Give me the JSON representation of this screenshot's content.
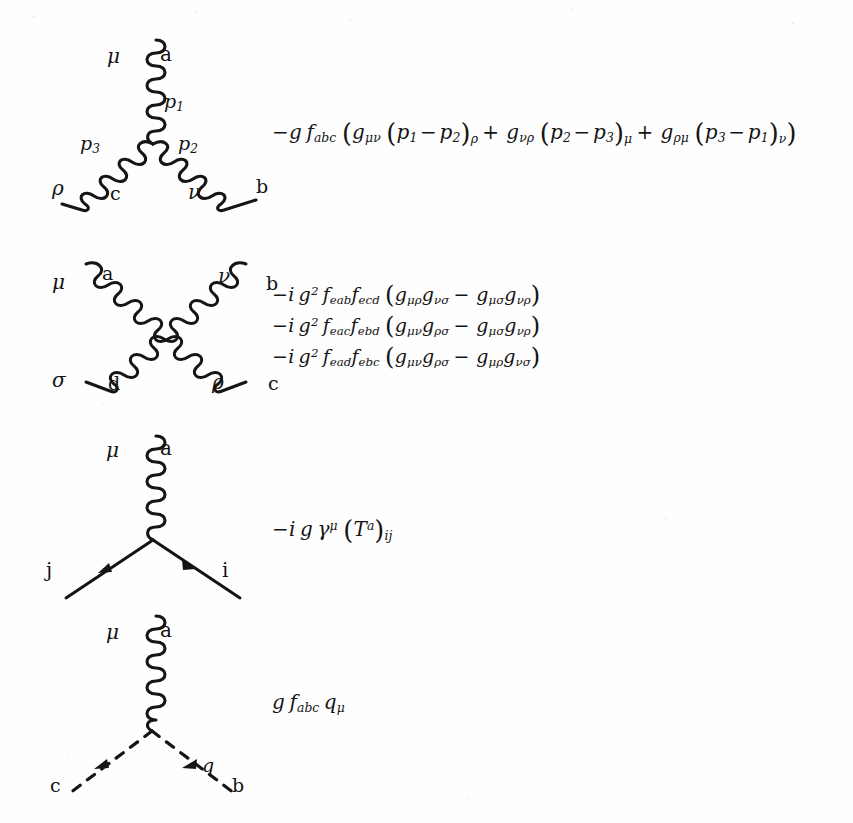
{
  "document": {
    "kind": "feynman-rules-figure",
    "ink_color": "#151515",
    "background_color": "#fefefe"
  },
  "rules": [
    {
      "id": "three-gluon-vertex",
      "diagram": {
        "type": "three-gluon-vertex",
        "legs": [
          {
            "id": "leg-top",
            "style": "gluon",
            "lorentz_index": "μ",
            "color_index": "a",
            "momentum": "p₁"
          },
          {
            "id": "leg-lower-right",
            "style": "gluon",
            "lorentz_index": "ν",
            "color_index": "b",
            "momentum": "p₂"
          },
          {
            "id": "leg-lower-left",
            "style": "gluon",
            "lorentz_index": "ρ",
            "color_index": "c",
            "momentum": "p₃"
          }
        ]
      },
      "formula_lines": [
        "−g f_abc ( g_μν (p₁ − p₂)_ρ + g_νρ (p₂ − p₃)_μ + g_ρμ (p₃ − p₁)_ν )"
      ]
    },
    {
      "id": "four-gluon-vertex",
      "diagram": {
        "type": "four-gluon-vertex",
        "legs": [
          {
            "id": "leg-upper-left",
            "style": "gluon",
            "lorentz_index": "μ",
            "color_index": "a"
          },
          {
            "id": "leg-upper-right",
            "style": "gluon",
            "lorentz_index": "ν",
            "color_index": "b"
          },
          {
            "id": "leg-lower-left",
            "style": "gluon",
            "lorentz_index": "σ",
            "color_index": "d"
          },
          {
            "id": "leg-lower-right",
            "style": "gluon",
            "lorentz_index": "ρ",
            "color_index": "c"
          }
        ]
      },
      "formula_lines": [
        "−i g² f_eab f_ecd ( g_μρ g_νσ − g_μσ g_νρ )",
        "−i g² f_eac f_ebd ( g_μν g_ρσ − g_μσ g_νρ )",
        "−i g² f_ead f_ebc ( g_μν g_ρσ − g_μρ g_νσ )"
      ]
    },
    {
      "id": "quark-gluon-vertex",
      "diagram": {
        "type": "quark-gluon-vertex",
        "legs": [
          {
            "id": "leg-gluon",
            "style": "gluon",
            "lorentz_index": "μ",
            "color_index": "a"
          },
          {
            "id": "leg-quark-left",
            "style": "fermion",
            "flavor_index": "j",
            "arrow": "outgoing-lower-left"
          },
          {
            "id": "leg-quark-right",
            "style": "fermion",
            "flavor_index": "i",
            "arrow": "incoming-lower-right"
          }
        ]
      },
      "formula_lines": [
        "−i g γ^μ (T^a)_ij"
      ]
    },
    {
      "id": "ghost-gluon-vertex",
      "diagram": {
        "type": "ghost-gluon-vertex",
        "legs": [
          {
            "id": "leg-gluon",
            "style": "gluon",
            "lorentz_index": "μ",
            "color_index": "a"
          },
          {
            "id": "leg-ghost-left",
            "style": "dashed",
            "color_index": "c",
            "arrow": "toward-vertex"
          },
          {
            "id": "leg-ghost-right",
            "style": "dashed",
            "color_index": "b",
            "arrow": "toward-vertex",
            "momentum": "q"
          }
        ]
      },
      "formula_lines": [
        "g f_abc q_μ"
      ]
    }
  ],
  "labels": {
    "mu": "μ",
    "nu": "ν",
    "rho": "ρ",
    "sigma": "σ",
    "a": "a",
    "b": "b",
    "c": "c",
    "d": "d",
    "i": "i",
    "j": "j",
    "q": "q",
    "p1": "p",
    "p1_sub": "1",
    "p2": "p",
    "p2_sub": "2",
    "p3": "p",
    "p3_sub": "3"
  },
  "formula_tokens": {
    "three_gluon": {
      "prefix_minus": "−",
      "g": "g",
      "f": "f",
      "f_sub": "abc",
      "open": "(",
      "close": ")",
      "g1": "g",
      "g1_sub": "μν",
      "p1": "p",
      "p1_sub": "1",
      "minus1": "−",
      "p2": "p",
      "p2_sub": "2",
      "idx1": "ρ",
      "plus1": "+",
      "g2": "g",
      "g2_sub": "νρ",
      "p3": "p",
      "p3_sub": "2",
      "minus2": "−",
      "p4": "p",
      "p4_sub": "3",
      "idx2": "μ",
      "plus2": "+",
      "g3": "g",
      "g3_sub": "ρμ",
      "p5": "p",
      "p5_sub": "3",
      "minus3": "−",
      "p6": "p",
      "p6_sub": "1",
      "idx3": "ν"
    },
    "four_gluon": [
      {
        "minus": "−",
        "i": "i",
        "g": "g",
        "exp": "2",
        "f1": "f",
        "f1_sub": "eab",
        "f2": "f",
        "f2_sub": "ecd",
        "open": "(",
        "ga": "g",
        "ga_sub": "μρ",
        "gb": "g",
        "gb_sub": "νσ",
        "op": "−",
        "gc": "g",
        "gc_sub": "μσ",
        "gd": "g",
        "gd_sub": "νρ",
        "close": ")"
      },
      {
        "minus": "−",
        "i": "i",
        "g": "g",
        "exp": "2",
        "f1": "f",
        "f1_sub": "eac",
        "f2": "f",
        "f2_sub": "ebd",
        "open": "(",
        "ga": "g",
        "ga_sub": "μν",
        "gb": "g",
        "gb_sub": "ρσ",
        "op": "−",
        "gc": "g",
        "gc_sub": "μσ",
        "gd": "g",
        "gd_sub": "νρ",
        "close": ")"
      },
      {
        "minus": "−",
        "i": "i",
        "g": "g",
        "exp": "2",
        "f1": "f",
        "f1_sub": "ead",
        "f2": "f",
        "f2_sub": "ebc",
        "open": "(",
        "ga": "g",
        "ga_sub": "μν",
        "gb": "g",
        "gb_sub": "ρσ",
        "op": "−",
        "gc": "g",
        "gc_sub": "μρ",
        "gd": "g",
        "gd_sub": "νσ",
        "close": ")"
      }
    ],
    "quark_gluon": {
      "minus": "−",
      "i": "i",
      "g": "g",
      "gamma": "γ",
      "gamma_sup": "μ",
      "open": "(",
      "T": "T",
      "T_sup": "a",
      "close": ")",
      "T_sub": "ij"
    },
    "ghost_gluon": {
      "g": "g",
      "f": "f",
      "f_sub": "abc",
      "q": "q",
      "q_sub": "μ"
    }
  }
}
